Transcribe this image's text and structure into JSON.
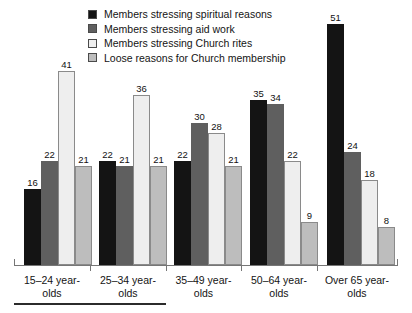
{
  "chart_data": {
    "type": "bar",
    "title": "",
    "xlabel": "",
    "ylabel": "",
    "ylim": [
      0,
      57
    ],
    "grid": false,
    "legend_position": "top-center",
    "categories": [
      "15–24 year-olds",
      "25–34 year-olds",
      "35–49 year-olds",
      "50–64 year-olds",
      "Over 65 year-olds"
    ],
    "series": [
      {
        "name": "Members stressing spiritual reasons",
        "color": "#141414",
        "values": [
          16,
          22,
          22,
          35,
          51
        ]
      },
      {
        "name": "Members stressing aid work",
        "color": "#5f5f5f",
        "values": [
          22,
          21,
          30,
          34,
          24
        ]
      },
      {
        "name": "Members stressing Church rites",
        "color": "#eeeeee",
        "values": [
          41,
          36,
          28,
          22,
          18
        ]
      },
      {
        "name": "Loose reasons for Church membership",
        "color": "#bdbdbd",
        "values": [
          21,
          21,
          21,
          9,
          8
        ]
      }
    ]
  },
  "legend": {
    "items": [
      {
        "label": "Members stressing spiritual reasons",
        "color": "#141414"
      },
      {
        "label": "Members stressing aid work",
        "color": "#5f5f5f"
      },
      {
        "label": "Members stressing Church rites",
        "color": "#eeeeee"
      },
      {
        "label": "Loose reasons for Church membership",
        "color": "#bdbdbd"
      }
    ]
  },
  "axis": {
    "labels": [
      {
        "line1": "15–24 year-",
        "line2": "olds"
      },
      {
        "line1": "25–34 year-",
        "line2": "olds"
      },
      {
        "line1": "35–49 year-",
        "line2": "olds"
      },
      {
        "line1": "50–64 year-",
        "line2": "olds"
      },
      {
        "line1": "Over 65 year-",
        "line2": "olds"
      }
    ]
  },
  "style": {
    "axis_color": "#767676",
    "text_color": "#141414",
    "background": "#ffffff"
  }
}
